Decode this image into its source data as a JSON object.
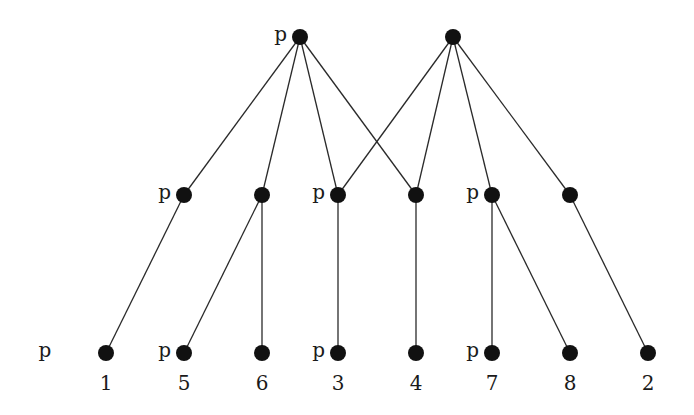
{
  "diagram": {
    "type": "layered-graph",
    "node_color": "#111111",
    "edge_color": "#2a2a2a",
    "nodes": [
      {
        "id": "t1",
        "layer": "top",
        "marker": "p",
        "label": ""
      },
      {
        "id": "t2",
        "layer": "top",
        "marker": "",
        "label": ""
      },
      {
        "id": "m1",
        "layer": "middle",
        "marker": "p",
        "label": ""
      },
      {
        "id": "m2",
        "layer": "middle",
        "marker": "",
        "label": ""
      },
      {
        "id": "m3",
        "layer": "middle",
        "marker": "p",
        "label": ""
      },
      {
        "id": "m4",
        "layer": "middle",
        "marker": "",
        "label": ""
      },
      {
        "id": "m5",
        "layer": "middle",
        "marker": "p",
        "label": ""
      },
      {
        "id": "m6",
        "layer": "middle",
        "marker": "",
        "label": ""
      },
      {
        "id": "b1",
        "layer": "bottom",
        "marker": "",
        "label": "1"
      },
      {
        "id": "b5",
        "layer": "bottom",
        "marker": "p",
        "label": "5"
      },
      {
        "id": "b6",
        "layer": "bottom",
        "marker": "",
        "label": "6"
      },
      {
        "id": "b3",
        "layer": "bottom",
        "marker": "p",
        "label": "3"
      },
      {
        "id": "b4",
        "layer": "bottom",
        "marker": "",
        "label": "4"
      },
      {
        "id": "b7",
        "layer": "bottom",
        "marker": "p",
        "label": "7"
      },
      {
        "id": "b8",
        "layer": "bottom",
        "marker": "",
        "label": "8"
      },
      {
        "id": "b2",
        "layer": "bottom",
        "marker": "",
        "label": "2"
      }
    ],
    "edges": [
      [
        "t1",
        "m1"
      ],
      [
        "t1",
        "m2"
      ],
      [
        "t1",
        "m3"
      ],
      [
        "t1",
        "m4"
      ],
      [
        "t2",
        "m3"
      ],
      [
        "t2",
        "m4"
      ],
      [
        "t2",
        "m5"
      ],
      [
        "t2",
        "m6"
      ],
      [
        "m1",
        "b1"
      ],
      [
        "m2",
        "b5"
      ],
      [
        "m2",
        "b6"
      ],
      [
        "m3",
        "b3"
      ],
      [
        "m4",
        "b4"
      ],
      [
        "m5",
        "b7"
      ],
      [
        "m5",
        "b8"
      ],
      [
        "m6",
        "b2"
      ]
    ],
    "free_labels": [
      {
        "text": "p",
        "near": "b1",
        "position": "far-left"
      }
    ]
  }
}
